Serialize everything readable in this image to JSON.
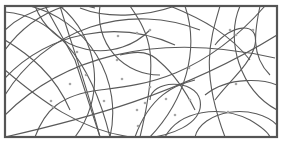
{
  "diagram": {
    "type": "intersecting-curves-with-points",
    "width": 283,
    "height": 142,
    "colors": {
      "background": "#ffffff",
      "frame": "#555555",
      "curve": "#5a5a5a",
      "dot": "#a6a6a6"
    },
    "frame": {
      "x": 5,
      "y": 6,
      "width": 272,
      "height": 131
    },
    "curves": [
      "M5,30 A95,95 0 0 1 95,8",
      "M5,50 A120,120 0 0 1 140,6",
      "M30,6 A110,110 0 0 1 110,137",
      "M60,6 A95,95 0 0 1 75,137",
      "M5,78 A150,150 0 0 1 175,45",
      "M35,6 A70,70 0 0 0 150,30",
      "M100,6 A60,60 0 0 0 160,75",
      "M130,6 C150,35 160,55 140,137",
      "M185,6 C200,50 185,100 150,137",
      "M5,12 C50,15 90,55 110,137",
      "M5,95 A160,160 0 0 1 200,30",
      "M5,115 C60,60 150,30 275,58",
      "M5,137 C80,120 180,95 277,35",
      "M35,137 C45,110 60,95 100,90 C140,85 200,80 265,6",
      "M60,6 C70,40 85,80 100,137",
      "M170,6 C205,20 230,35 250,60",
      "M220,6 C210,40 200,70 225,137",
      "M240,6 C225,40 240,90 277,110",
      "M260,6 C255,30 250,55 270,75",
      "M215,45 C230,25 260,20 255,45 C250,65 230,80 215,100",
      "M45,6 L75,60 L100,137",
      "M195,80 C175,85 150,95 135,137",
      "M205,95 C230,75 265,80 277,85",
      "M150,100 C150,80 195,78 200,100 C205,125 165,137 150,137",
      "M5,70 C40,100 80,130 130,137",
      "M165,137 C180,110 220,105 250,120 C260,126 268,132 270,137",
      "M195,137 A45,30 0 0 1 277,125",
      "M120,55 C140,50 150,52 160,62 C175,75 185,90 195,110",
      "M5,40 C30,55 55,75 70,110",
      "M80,8 C110,20 150,15 175,6"
    ],
    "points": [
      [
        118,
        36
      ],
      [
        137,
        33
      ],
      [
        77,
        52
      ],
      [
        117,
        60
      ],
      [
        150,
        30
      ],
      [
        230,
        30
      ],
      [
        236,
        35
      ],
      [
        253,
        30
      ],
      [
        86,
        75
      ],
      [
        122,
        79
      ],
      [
        51,
        101
      ],
      [
        70,
        84
      ],
      [
        189,
        68
      ],
      [
        236,
        84
      ],
      [
        166,
        99
      ],
      [
        175,
        115
      ],
      [
        137,
        110
      ],
      [
        145,
        103
      ],
      [
        228,
        112
      ],
      [
        138,
        126
      ],
      [
        53,
        107
      ],
      [
        150,
        87
      ],
      [
        190,
        100
      ],
      [
        104,
        101
      ]
    ]
  }
}
